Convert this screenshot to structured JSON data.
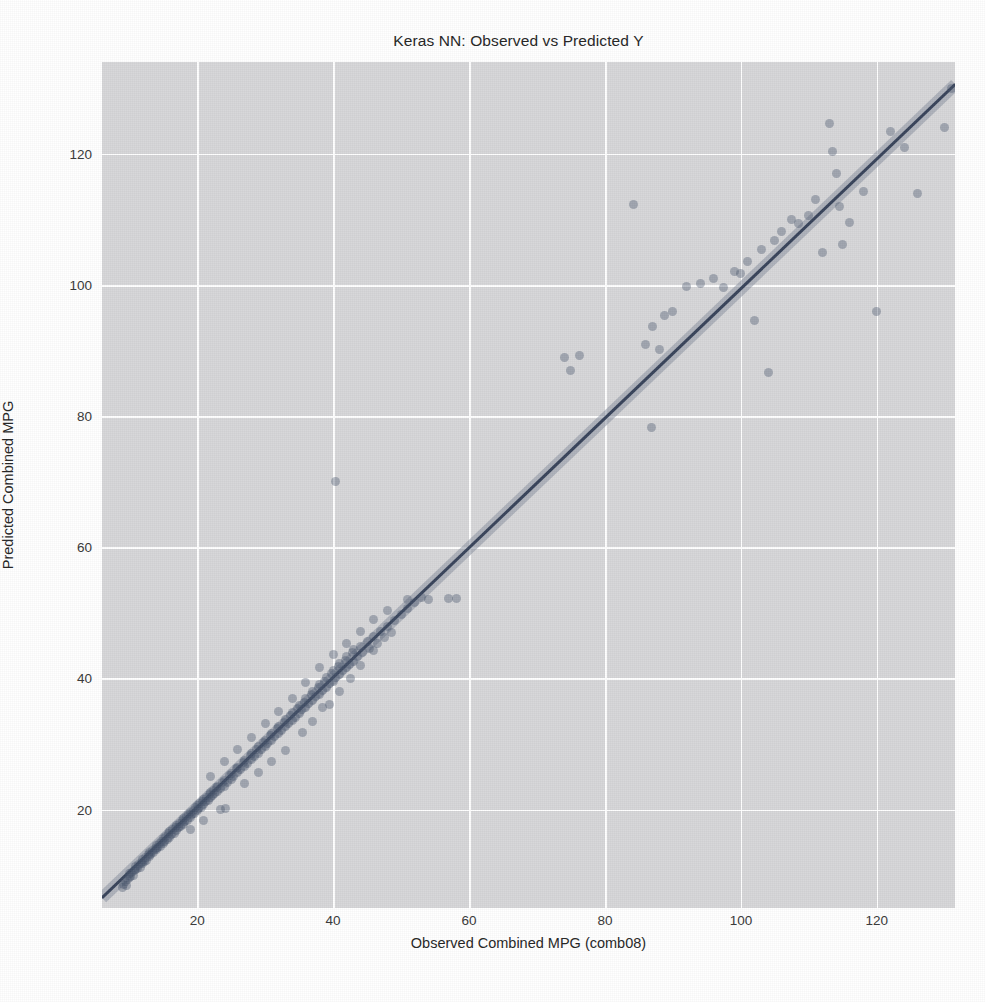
{
  "chart_data": {
    "type": "scatter",
    "title": "Keras NN: Observed vs Predicted Y",
    "xlabel": "Observed Combined MPG (comb08)",
    "ylabel": "Predicted Combined MPG",
    "xlim": [
      6.0,
      131.5
    ],
    "ylim": [
      5.0,
      134.0
    ],
    "xticks": [
      20,
      40,
      60,
      80,
      100,
      120
    ],
    "yticks": [
      20,
      40,
      60,
      80,
      100,
      120
    ],
    "xticklabels": [
      "20",
      "40",
      "60",
      "80",
      "100",
      "120"
    ],
    "yticklabels": [
      "20",
      "40",
      "60",
      "80",
      "100",
      "120"
    ],
    "grid": true,
    "legend": null,
    "style": "seaborn-darkgrid",
    "background_color": "#d7d7d9",
    "gridline_color": "#ffffff",
    "point_color": "#46536b",
    "point_opacity": 0.38,
    "line_color": "#2f3b52",
    "ci_band_color": "#8d93a3",
    "regression_line": {
      "description": "identity-like fit with shaded confidence band",
      "x0": 6.0,
      "y0": 6.5,
      "x1": 131.5,
      "y1": 130.5
    },
    "series": [
      {
        "name": "Observed vs Predicted",
        "marker": "circle",
        "points": [
          [
            9.0,
            8.1
          ],
          [
            9.2,
            8.6
          ],
          [
            9.4,
            9.0
          ],
          [
            9.6,
            8.4
          ],
          [
            9.8,
            9.3
          ],
          [
            10.0,
            9.6
          ],
          [
            10.0,
            10.2
          ],
          [
            10.2,
            9.8
          ],
          [
            10.4,
            10.4
          ],
          [
            10.6,
            10.0
          ],
          [
            10.8,
            10.7
          ],
          [
            11.0,
            10.9
          ],
          [
            11.0,
            11.4
          ],
          [
            11.2,
            11.0
          ],
          [
            11.4,
            11.6
          ],
          [
            11.6,
            11.2
          ],
          [
            11.8,
            12.0
          ],
          [
            12.0,
            11.8
          ],
          [
            12.0,
            12.4
          ],
          [
            12.2,
            12.1
          ],
          [
            12.4,
            12.7
          ],
          [
            12.6,
            12.3
          ],
          [
            12.8,
            13.1
          ],
          [
            13.0,
            12.9
          ],
          [
            13.0,
            13.5
          ],
          [
            13.2,
            13.2
          ],
          [
            13.4,
            13.8
          ],
          [
            13.6,
            13.4
          ],
          [
            13.8,
            14.1
          ],
          [
            14.0,
            13.9
          ],
          [
            14.0,
            14.6
          ],
          [
            14.2,
            14.2
          ],
          [
            14.4,
            14.9
          ],
          [
            14.6,
            14.4
          ],
          [
            14.8,
            15.2
          ],
          [
            15.0,
            14.8
          ],
          [
            15.0,
            15.6
          ],
          [
            15.2,
            15.2
          ],
          [
            15.4,
            15.9
          ],
          [
            15.6,
            15.4
          ],
          [
            15.8,
            16.3
          ],
          [
            16.0,
            15.8
          ],
          [
            16.0,
            16.6
          ],
          [
            16.2,
            16.2
          ],
          [
            16.4,
            16.9
          ],
          [
            16.6,
            16.4
          ],
          [
            16.8,
            17.3
          ],
          [
            17.0,
            16.8
          ],
          [
            17.0,
            17.6
          ],
          [
            17.2,
            17.2
          ],
          [
            17.4,
            17.9
          ],
          [
            17.6,
            17.4
          ],
          [
            17.8,
            18.3
          ],
          [
            18.0,
            17.8
          ],
          [
            18.0,
            18.6
          ],
          [
            18.2,
            18.2
          ],
          [
            18.4,
            18.9
          ],
          [
            18.6,
            18.4
          ],
          [
            18.8,
            19.3
          ],
          [
            19.0,
            18.8
          ],
          [
            19.0,
            19.6
          ],
          [
            19.2,
            19.2
          ],
          [
            19.4,
            19.9
          ],
          [
            19.6,
            19.4
          ],
          [
            19.8,
            20.3
          ],
          [
            20.0,
            19.8
          ],
          [
            20.0,
            20.6
          ],
          [
            20.2,
            20.2
          ],
          [
            20.4,
            20.9
          ],
          [
            20.6,
            20.4
          ],
          [
            20.8,
            21.3
          ],
          [
            21.0,
            20.8
          ],
          [
            21.0,
            21.6
          ],
          [
            21.2,
            21.2
          ],
          [
            21.4,
            21.9
          ],
          [
            21.6,
            21.4
          ],
          [
            21.8,
            22.3
          ],
          [
            22.0,
            21.8
          ],
          [
            22.0,
            22.6
          ],
          [
            22.2,
            22.2
          ],
          [
            22.4,
            22.9
          ],
          [
            22.6,
            22.4
          ],
          [
            22.8,
            23.3
          ],
          [
            23.0,
            22.8
          ],
          [
            23.0,
            23.6
          ],
          [
            23.4,
            23.2
          ],
          [
            23.8,
            24.2
          ],
          [
            24.0,
            23.6
          ],
          [
            24.0,
            24.5
          ],
          [
            24.4,
            24.1
          ],
          [
            24.8,
            25.2
          ],
          [
            25.0,
            24.6
          ],
          [
            25.0,
            25.5
          ],
          [
            25.4,
            25.1
          ],
          [
            25.8,
            26.2
          ],
          [
            26.0,
            25.6
          ],
          [
            26.0,
            26.5
          ],
          [
            26.4,
            26.1
          ],
          [
            26.8,
            27.2
          ],
          [
            27.0,
            26.6
          ],
          [
            27.0,
            27.5
          ],
          [
            27.4,
            27.1
          ],
          [
            27.8,
            28.2
          ],
          [
            28.0,
            27.6
          ],
          [
            28.0,
            28.5
          ],
          [
            28.4,
            28.1
          ],
          [
            28.8,
            29.2
          ],
          [
            29.0,
            28.6
          ],
          [
            29.0,
            29.6
          ],
          [
            29.4,
            29.1
          ],
          [
            29.8,
            30.2
          ],
          [
            30.0,
            29.6
          ],
          [
            30.0,
            30.6
          ],
          [
            30.4,
            30.1
          ],
          [
            30.8,
            31.3
          ],
          [
            31.0,
            30.6
          ],
          [
            31.0,
            31.6
          ],
          [
            31.4,
            31.1
          ],
          [
            31.8,
            32.3
          ],
          [
            32.0,
            31.6
          ],
          [
            32.0,
            32.7
          ],
          [
            32.4,
            32.1
          ],
          [
            32.8,
            33.3
          ],
          [
            33.0,
            32.6
          ],
          [
            33.0,
            33.8
          ],
          [
            33.4,
            33.1
          ],
          [
            33.8,
            34.4
          ],
          [
            34.0,
            33.6
          ],
          [
            34.0,
            34.8
          ],
          [
            34.4,
            34.1
          ],
          [
            34.8,
            35.4
          ],
          [
            35.0,
            34.6
          ],
          [
            35.0,
            35.9
          ],
          [
            35.4,
            35.2
          ],
          [
            35.8,
            36.4
          ],
          [
            36.0,
            35.6
          ],
          [
            36.0,
            37.0
          ],
          [
            36.4,
            36.2
          ],
          [
            36.8,
            37.5
          ],
          [
            37.0,
            36.6
          ],
          [
            37.0,
            38.0
          ],
          [
            37.4,
            37.2
          ],
          [
            37.8,
            38.6
          ],
          [
            38.0,
            37.6
          ],
          [
            38.0,
            39.1
          ],
          [
            38.4,
            38.2
          ],
          [
            38.8,
            39.6
          ],
          [
            39.0,
            38.6
          ],
          [
            39.0,
            40.2
          ],
          [
            39.4,
            39.2
          ],
          [
            39.8,
            40.7
          ],
          [
            40.0,
            39.6
          ],
          [
            40.0,
            41.2
          ],
          [
            40.4,
            40.2
          ],
          [
            40.8,
            41.8
          ],
          [
            41.0,
            40.6
          ],
          [
            41.0,
            42.3
          ],
          [
            41.4,
            41.2
          ],
          [
            41.8,
            42.8
          ],
          [
            42.0,
            41.6
          ],
          [
            42.0,
            43.4
          ],
          [
            42.4,
            42.2
          ],
          [
            42.8,
            43.9
          ],
          [
            43.0,
            42.6
          ],
          [
            43.0,
            44.4
          ],
          [
            43.6,
            43.3
          ],
          [
            44.0,
            44.9
          ],
          [
            44.4,
            43.9
          ],
          [
            45.0,
            45.6
          ],
          [
            45.4,
            44.6
          ],
          [
            46.0,
            46.4
          ],
          [
            46.6,
            45.4
          ],
          [
            47.0,
            47.2
          ],
          [
            47.6,
            46.2
          ],
          [
            48.0,
            48.0
          ],
          [
            48.6,
            47.0
          ],
          [
            49.0,
            48.8
          ],
          [
            50.0,
            49.8
          ],
          [
            51.0,
            50.6
          ],
          [
            52.0,
            51.6
          ],
          [
            53.0,
            52.4
          ],
          [
            23.5,
            20.0
          ],
          [
            24.2,
            20.2
          ],
          [
            19.0,
            17.0
          ],
          [
            21.0,
            18.4
          ],
          [
            27.0,
            24.0
          ],
          [
            29.0,
            25.6
          ],
          [
            31.0,
            27.4
          ],
          [
            33.0,
            29.0
          ],
          [
            35.5,
            31.8
          ],
          [
            37.0,
            33.4
          ],
          [
            38.5,
            35.6
          ],
          [
            39.5,
            36.0
          ],
          [
            41.0,
            38.0
          ],
          [
            42.5,
            40.0
          ],
          [
            44.0,
            42.0
          ],
          [
            46.0,
            44.2
          ],
          [
            28.0,
            31.0
          ],
          [
            26.0,
            29.2
          ],
          [
            24.0,
            27.4
          ],
          [
            22.0,
            25.0
          ],
          [
            30.0,
            33.2
          ],
          [
            32.0,
            35.0
          ],
          [
            34.0,
            37.0
          ],
          [
            36.0,
            39.4
          ],
          [
            38.0,
            41.6
          ],
          [
            40.0,
            43.6
          ],
          [
            42.0,
            45.4
          ],
          [
            44.0,
            47.2
          ],
          [
            46.0,
            49.0
          ],
          [
            48.0,
            50.4
          ],
          [
            40.3,
            70.0
          ],
          [
            51.0,
            52.0
          ],
          [
            54.0,
            52.0
          ],
          [
            57.0,
            52.2
          ],
          [
            58.2,
            52.2
          ],
          [
            74.0,
            89.0
          ],
          [
            76.3,
            89.2
          ],
          [
            75.0,
            87.0
          ],
          [
            84.2,
            112.3
          ],
          [
            86.8,
            78.2
          ],
          [
            86.0,
            91.0
          ],
          [
            87.0,
            93.6
          ],
          [
            88.0,
            90.2
          ],
          [
            88.8,
            95.4
          ],
          [
            90.0,
            96.0
          ],
          [
            92.0,
            99.8
          ],
          [
            94.0,
            100.2
          ],
          [
            96.0,
            101.0
          ],
          [
            97.5,
            99.6
          ],
          [
            99.0,
            102.0
          ],
          [
            100.0,
            101.8
          ],
          [
            101.0,
            103.6
          ],
          [
            102.0,
            94.6
          ],
          [
            103.0,
            105.4
          ],
          [
            104.0,
            86.6
          ],
          [
            105.0,
            106.8
          ],
          [
            106.0,
            108.2
          ],
          [
            107.5,
            110.0
          ],
          [
            108.5,
            109.4
          ],
          [
            110.0,
            110.6
          ],
          [
            111.0,
            113.0
          ],
          [
            112.0,
            105.0
          ],
          [
            113.0,
            124.6
          ],
          [
            113.5,
            120.4
          ],
          [
            114.0,
            117.0
          ],
          [
            114.5,
            112.0
          ],
          [
            115.0,
            106.2
          ],
          [
            116.0,
            109.6
          ],
          [
            118.0,
            114.2
          ],
          [
            120.0,
            96.0
          ],
          [
            122.0,
            123.4
          ],
          [
            124.0,
            121.0
          ],
          [
            126.0,
            114.0
          ],
          [
            130.0,
            124.0
          ],
          [
            131.0,
            130.0
          ]
        ]
      }
    ]
  },
  "axis": {
    "x_ticks": [
      "20",
      "40",
      "60",
      "80",
      "100",
      "120"
    ],
    "y_ticks": [
      "20",
      "40",
      "60",
      "80",
      "100",
      "120"
    ]
  }
}
